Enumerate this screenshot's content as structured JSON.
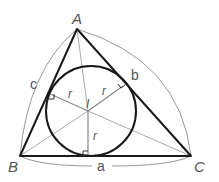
{
  "diagram": {
    "vertices": {
      "A": {
        "label": "A",
        "x": 77,
        "y": 29
      },
      "B": {
        "label": "B",
        "x": 20,
        "y": 156
      },
      "C": {
        "label": "C",
        "x": 191,
        "y": 156
      }
    },
    "incenter": {
      "label": "I",
      "x": 88,
      "y": 111
    },
    "inradius": 45,
    "sides": {
      "a": {
        "label": "a"
      },
      "b": {
        "label": "b"
      },
      "c": {
        "label": "c"
      }
    },
    "radius_labels": [
      "r",
      "r",
      "r"
    ],
    "colors": {
      "triangle": "#1a1a1a",
      "circle": "#1a1a1a",
      "bisector": "#aaaaaa",
      "radius": "#888888",
      "arc": "#999999",
      "label": "#555555"
    }
  }
}
